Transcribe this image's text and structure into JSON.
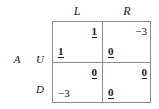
{
  "figure": {
    "type": "normal-form-payoff-matrix",
    "row_player": "A",
    "row_strategies": [
      "U",
      "D"
    ],
    "column_strategies": [
      "L",
      "R"
    ],
    "payoff_order": "column player payoff top-right, row player payoff bottom-left",
    "border_color": "#8c8c8c",
    "text_color": "#1a1a1a",
    "background": "#ffffff"
  },
  "headers": {
    "row_player_label": "A",
    "col_L": "L",
    "col_R": "R",
    "row_U": "U",
    "row_D": "D"
  },
  "cells": {
    "UL": {
      "col_payoff": "1",
      "row_payoff": "1",
      "col_payoff_best": true,
      "row_payoff_best": true
    },
    "UR": {
      "col_payoff": "−3",
      "row_payoff": "0",
      "col_payoff_best": false,
      "row_payoff_best": true
    },
    "DL": {
      "col_payoff": "0",
      "row_payoff": "−3",
      "col_payoff_best": true,
      "row_payoff_best": false
    },
    "DR": {
      "col_payoff": "0",
      "row_payoff": "0",
      "col_payoff_best": true,
      "row_payoff_best": true
    }
  },
  "chart_data": {
    "type": "table",
    "title": "",
    "row_player": "A",
    "row_labels": [
      "U",
      "D"
    ],
    "column_labels": [
      "L",
      "R"
    ],
    "cell_format": [
      "column_player_payoff",
      "row_player_payoff"
    ],
    "matrix": [
      [
        {
          "column_payoff": 1,
          "row_payoff": 1,
          "column_underlined": true,
          "row_underlined": true
        },
        {
          "column_payoff": -3,
          "row_payoff": 0,
          "column_underlined": false,
          "row_underlined": true
        }
      ],
      [
        {
          "column_payoff": 0,
          "row_payoff": -3,
          "column_underlined": true,
          "row_underlined": false
        },
        {
          "column_payoff": 0,
          "row_payoff": 0,
          "column_underlined": true,
          "row_underlined": true
        }
      ]
    ],
    "annotation": "Bold underlined entries mark best responses",
    "grid": true,
    "legend": "none"
  }
}
